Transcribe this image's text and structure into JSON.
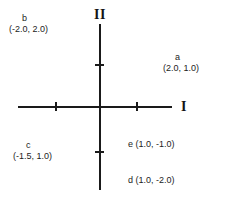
{
  "chart_data": {
    "type": "scatter",
    "title": "",
    "xlabel": "I",
    "ylabel": "II",
    "grid": false,
    "legend": "none",
    "xlim": [
      -2.5,
      2.5
    ],
    "ylim": [
      -2.5,
      2.5
    ],
    "x_ticks": [
      -1.0,
      1.0
    ],
    "y_ticks": [
      1.0,
      -1.0
    ],
    "axis_labels": {
      "horizontal": "I",
      "vertical": "II"
    },
    "points": [
      {
        "name": "a",
        "x": 2.0,
        "y": 1.0,
        "coords_text": "(2.0, 1.0)",
        "label_text": "a",
        "quadrant": "upper-right"
      },
      {
        "name": "b",
        "x": -2.0,
        "y": 2.0,
        "coords_text": "(-2.0, 2.0)",
        "label_text": "b",
        "quadrant": "upper-left"
      },
      {
        "name": "c",
        "x": -1.5,
        "y": 1.0,
        "coords_text": "(-1.5, 1.0)",
        "label_text": "c",
        "quadrant": "lower-left"
      },
      {
        "name": "d",
        "x": 1.0,
        "y": -2.0,
        "coords_text": "d (1.0, -2.0)",
        "label_text": "d",
        "quadrant": "lower-right"
      },
      {
        "name": "e",
        "x": 1.0,
        "y": -1.0,
        "coords_text": "e (1.0, -1.0)",
        "label_text": "e",
        "quadrant": "lower-right"
      }
    ]
  },
  "labels": {
    "b": {
      "name": "b",
      "coords": "(-2.0, 2.0)"
    },
    "a": {
      "name": "a",
      "coords": "(2.0, 1.0)"
    },
    "c": {
      "name": "c",
      "coords": "(-1.5, 1.0)"
    },
    "e": {
      "text": "e (1.0, -1.0)"
    },
    "d": {
      "text": "d (1.0, -2.0)"
    }
  },
  "axes": {
    "horizontal_label": "I",
    "vertical_label": "II"
  },
  "colors": {
    "axis": "#1a1a1a",
    "text": "#1c1c1c",
    "background": "#ffffff"
  }
}
